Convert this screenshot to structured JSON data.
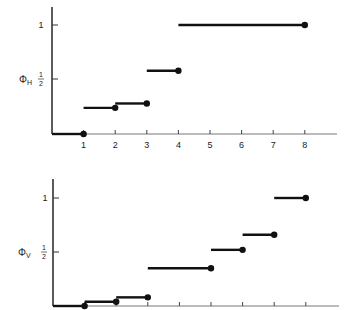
{
  "chart_data": [
    {
      "type": "line",
      "subtype": "step",
      "title": "",
      "ylabel": "ΦH",
      "ylabel_symbol": "Φ",
      "ylabel_subscript": "H",
      "xlabel": "",
      "x_ticks": [
        "1",
        "2",
        "3",
        "4",
        "5",
        "6",
        "7",
        "8"
      ],
      "y_ticks": [
        {
          "label": "1",
          "value": 1
        },
        {
          "label": "1/2",
          "value": 0.5
        }
      ],
      "xlim": [
        0,
        9
      ],
      "ylim": [
        0,
        1.15
      ],
      "grid": false,
      "segments": [
        {
          "x_start": 0,
          "x_end": 1,
          "y": 0
        },
        {
          "x_start": 1,
          "x_end": 2,
          "y": 0.24
        },
        {
          "x_start": 2,
          "x_end": 3,
          "y": 0.28
        },
        {
          "x_start": 3,
          "x_end": 4,
          "y": 0.58
        },
        {
          "x_start": 4,
          "x_end": 8,
          "y": 1.0
        }
      ],
      "endpoint_marker": "filled-circle-at-right-end"
    },
    {
      "type": "line",
      "subtype": "step",
      "title": "",
      "ylabel": "ΦV",
      "ylabel_symbol": "Φ",
      "ylabel_subscript": "V",
      "xlabel": "",
      "x_ticks": [
        "",
        "",
        "",
        "",
        "",
        "",
        "",
        ""
      ],
      "y_ticks": [
        {
          "label": "1",
          "value": 1
        },
        {
          "label": "1/2",
          "value": 0.5
        }
      ],
      "xlim": [
        0,
        9
      ],
      "ylim": [
        0,
        1.15
      ],
      "grid": false,
      "segments": [
        {
          "x_start": 0,
          "x_end": 1,
          "y": 0
        },
        {
          "x_start": 1,
          "x_end": 2,
          "y": 0.04
        },
        {
          "x_start": 2,
          "x_end": 3,
          "y": 0.08
        },
        {
          "x_start": 3,
          "x_end": 5,
          "y": 0.35
        },
        {
          "x_start": 5,
          "x_end": 6,
          "y": 0.52
        },
        {
          "x_start": 6,
          "x_end": 7,
          "y": 0.66
        },
        {
          "x_start": 7,
          "x_end": 8,
          "y": 1.0
        }
      ],
      "endpoint_marker": "filled-circle-at-right-end"
    }
  ],
  "labels": {
    "top": {
      "phi": "Φ",
      "sub": "H",
      "y1": "1",
      "yhalf_num": "1",
      "yhalf_den": "2"
    },
    "bottom": {
      "phi": "Φ",
      "sub": "V",
      "y1": "1",
      "yhalf_num": "1",
      "yhalf_den": "2"
    },
    "x_ticks": [
      "1",
      "2",
      "3",
      "4",
      "5",
      "6",
      "7",
      "8"
    ]
  },
  "colors": {
    "ink": "#111111",
    "axis": "#333333"
  }
}
